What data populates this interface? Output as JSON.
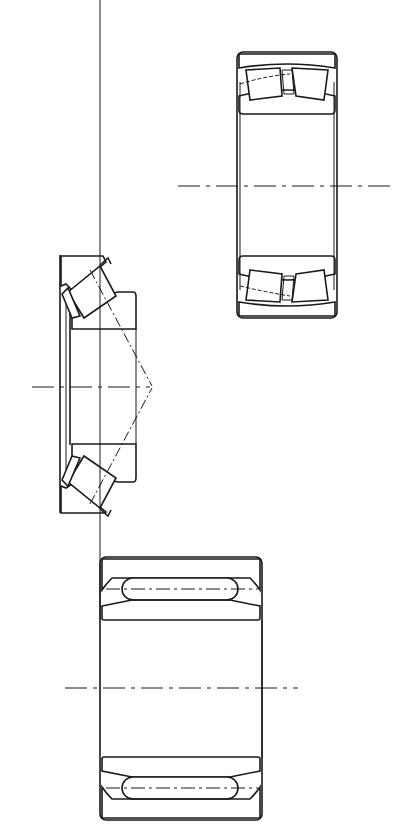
{
  "figure": {
    "background": "#ffffff",
    "line_color": "#1a1a1a",
    "bearings": [
      {
        "id": "spherical-roller-bearing",
        "label": "",
        "position": "top-right"
      },
      {
        "id": "tapered-roller-bearing",
        "label": "",
        "position": "middle-left"
      },
      {
        "id": "needle-roller-bearing",
        "label": "",
        "position": "bottom-center"
      }
    ]
  }
}
